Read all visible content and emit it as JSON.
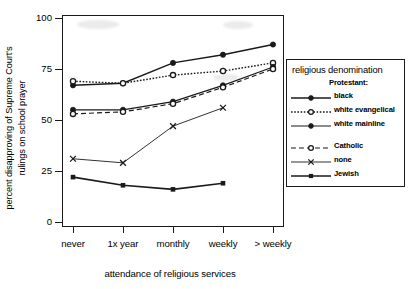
{
  "chart_data": {
    "type": "line",
    "title": "",
    "xlabel": "attendance of religious services",
    "ylabel": "percent disapproving of Supreme Court's\nrulings on school prayer",
    "categories": [
      "never",
      "1x year",
      "monthly",
      "weekly",
      "> weekly"
    ],
    "yticks": [
      0,
      25,
      50,
      75,
      100
    ],
    "ylim": [
      0,
      100
    ],
    "grid": false,
    "legend_position": "right-outside",
    "series": [
      {
        "name": "black",
        "group": "Protestant:",
        "values": [
          67,
          68,
          78,
          82,
          87
        ],
        "style": "solid",
        "marker": "filled-circle",
        "color": "#1a1a1a",
        "width": 1.5
      },
      {
        "name": "white evangelical",
        "group": "Protestant:",
        "values": [
          69,
          68,
          72,
          74,
          78
        ],
        "style": "dotted",
        "marker": "open-circle",
        "color": "#1a1a1a",
        "width": 1.4
      },
      {
        "name": "white mainline",
        "group": "Protestant:",
        "values": [
          55,
          55,
          59,
          67,
          76
        ],
        "style": "solid",
        "marker": "filled-circle",
        "color": "#1a1a1a",
        "width": 1.2
      },
      {
        "name": "Catholic",
        "group": "",
        "values": [
          53,
          54,
          58,
          66,
          75
        ],
        "style": "dashed",
        "marker": "open-circle",
        "color": "#1a1a1a",
        "width": 1.2
      },
      {
        "name": "none",
        "group": "",
        "values": [
          31,
          29,
          47,
          56,
          null
        ],
        "style": "solid-thin",
        "marker": "cross",
        "color": "#1a1a1a",
        "width": 0.9
      },
      {
        "name": "Jewish",
        "group": "",
        "values": [
          22,
          18,
          16,
          19,
          null
        ],
        "style": "solid",
        "marker": "filled-square",
        "color": "#1a1a1a",
        "width": 1.6
      }
    ]
  },
  "legend": {
    "title": "religious denomination",
    "subheading": "Protestant:",
    "items": [
      {
        "label": "black"
      },
      {
        "label": "white evangelical"
      },
      {
        "label": "white mainline"
      },
      {
        "label": "Catholic"
      },
      {
        "label": "none"
      },
      {
        "label": "Jewish"
      }
    ]
  },
  "axes": {
    "x_title": "attendance of religious services",
    "y_title": "percent disapproving of Supreme Court's\nrulings on school prayer",
    "x_tick_labels": [
      "never",
      "1x year",
      "monthly",
      "weekly",
      "> weekly"
    ],
    "y_tick_labels": [
      "0",
      "25",
      "50",
      "75",
      "100"
    ]
  }
}
